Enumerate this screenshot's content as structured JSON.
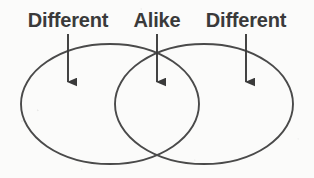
{
  "diagram": {
    "type": "venn-two-set",
    "ink_color": "#3a3a3a",
    "outline_color": "#4a4a4a",
    "background_color": "#fbfbfa",
    "labels": [
      {
        "id": "left",
        "text": "Different",
        "points_to": "left-only-region"
      },
      {
        "id": "middle",
        "text": "Alike",
        "points_to": "overlap-region"
      },
      {
        "id": "right",
        "text": "Different",
        "points_to": "right-only-region"
      }
    ],
    "arrows": [
      {
        "id": "left-arrow",
        "direction": "down",
        "target": "left-only-region"
      },
      {
        "id": "middle-arrow",
        "direction": "down",
        "target": "overlap-region"
      },
      {
        "id": "right-arrow",
        "direction": "down",
        "target": "right-only-region"
      }
    ],
    "ellipses": [
      {
        "id": "left-ellipse",
        "cx": 110,
        "cy": 104,
        "rx": 89,
        "ry": 60
      },
      {
        "id": "right-ellipse",
        "cx": 204,
        "cy": 104,
        "rx": 89,
        "ry": 60
      }
    ]
  }
}
